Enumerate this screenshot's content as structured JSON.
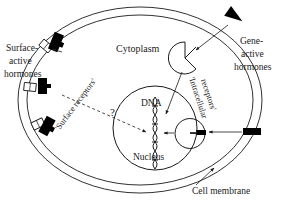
{
  "figure": {
    "background_color": "#ffffff",
    "ink_color": "#1a1a1a",
    "fill_black": "#000000"
  },
  "labels": {
    "surface_active_hormones": {
      "line1": "Surface-",
      "line2": "active",
      "line3": "hormones"
    },
    "gene_active_hormones": {
      "line1": "Gene-",
      "line2": "active",
      "line3": "hormones"
    },
    "cytoplasm": "Cytoplasm",
    "surface_receptors": "'Surface receptors'",
    "intracellular_receptors": {
      "line1": "'Intracellular",
      "line2": "receptors'"
    },
    "dna": "DNA",
    "nucleus": "Nucleus",
    "cell_membrane": "Cell membrane",
    "question_mark": "?"
  },
  "structures": {
    "cell_membrane": {
      "name": "cell-membrane-bilayer",
      "shape": "ellipse",
      "center_x": 140,
      "center_y": 100,
      "outer_rx": 122,
      "outer_ry": 93,
      "inner_rx": 113,
      "inner_ry": 85
    },
    "nucleus": {
      "name": "nucleus",
      "shape": "circle",
      "center_x": 155,
      "center_y": 128,
      "radius": 42
    },
    "dna_helix": {
      "name": "dna-double-helix",
      "orientation": "vertical",
      "top_y": 98,
      "bottom_y": 172,
      "center_x": 155,
      "amplitude": 7,
      "turns": 4
    },
    "surface_receptors": [
      {
        "x": 48,
        "y": 47,
        "angle": -52
      },
      {
        "x": 32,
        "y": 88,
        "angle": -86
      },
      {
        "x": 39,
        "y": 125,
        "angle": -118
      }
    ],
    "surface_hormones": [
      {
        "x": 55,
        "y": 41,
        "angle": 20
      },
      {
        "x": 42,
        "y": 86,
        "angle": 0
      },
      {
        "x": 48,
        "y": 127,
        "angle": 25
      }
    ],
    "intracellular_receptors": [
      {
        "x": 185,
        "y": 58,
        "radius": 16,
        "notch_angle": 35
      },
      {
        "x": 190,
        "y": 133,
        "radius": 15,
        "notch_angle": 0
      }
    ],
    "gene_hormone_top": {
      "x": 236,
      "y": 16,
      "angle": 35
    },
    "gene_hormone_right": {
      "x": 252,
      "y": 132,
      "angle": 0
    }
  },
  "connectors": [
    {
      "name": "gene-hormone-to-receptor-arrow",
      "style": "solid-arrow"
    },
    {
      "name": "gene-hormone-right-to-receptor-arrow",
      "style": "solid-arrow"
    },
    {
      "name": "upper-receptor-to-dna-arrow",
      "style": "solid-arrow"
    },
    {
      "name": "lower-receptor-to-dna-arrow",
      "style": "solid-arrow"
    },
    {
      "name": "surface-receptor-to-nucleus-dashed-arrow",
      "style": "dashed-arrow"
    },
    {
      "name": "surface-hormone-to-receptor-arrow",
      "style": "solid-arrow"
    },
    {
      "name": "cell-membrane-leader-line",
      "style": "leader"
    }
  ]
}
